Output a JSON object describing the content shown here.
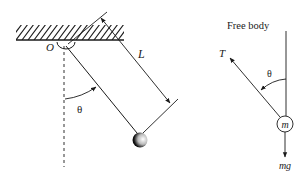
{
  "diagram": {
    "pendulum": {
      "pivot_label": "O",
      "length_label": "L",
      "angle_label": "θ"
    },
    "free_body": {
      "title": "Free body",
      "tension_label": "T",
      "angle_label": "θ",
      "mass_label": "m",
      "weight_label": "mg"
    },
    "colors": {
      "stroke": "#1a1a1a",
      "background": "#ffffff"
    }
  }
}
